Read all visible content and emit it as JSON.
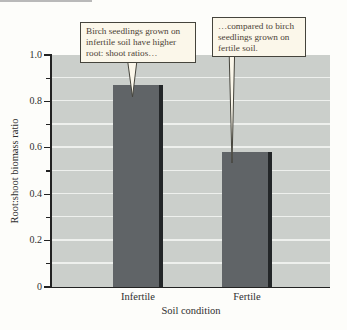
{
  "callouts": [
    {
      "text": "Birch seedlings grown on\ninfertile soil have higher\nroot: shoot ratios…"
    },
    {
      "text": "…compared to birch\nseedlings grown on\nfertile soil."
    }
  ],
  "chart_data": {
    "type": "bar",
    "title": "",
    "categories": [
      "Infertile",
      "Fertile"
    ],
    "values": [
      0.87,
      0.58
    ],
    "xlabel": "Soil condition",
    "ylabel": "Root:shoot biomass ratio",
    "ylim": [
      0,
      1.0
    ],
    "yticks": [
      0,
      0.2,
      0.4,
      0.6,
      0.8,
      1.0
    ],
    "ytick_labels": [
      "0",
      "0.2",
      "0.4",
      "0.6",
      "0.8",
      "1.0"
    ],
    "minor_tick_values": [
      0.1,
      0.3,
      0.5,
      0.7,
      0.9
    ],
    "gridline_step": 0.1,
    "grid": "horizontal white lines every 0.1, legend none",
    "colors": {
      "bar": "#606467",
      "bar_edge": "#232628",
      "plot_bg": "#cbcfcb",
      "gridline": "#eef0ed",
      "callout_bg": "#fbf7ea",
      "callout_border": "#45443c",
      "callout_text": "#4c4236",
      "axis": "#222222"
    }
  }
}
